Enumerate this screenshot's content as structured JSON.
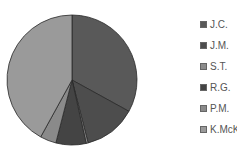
{
  "chart_data": {
    "type": "pie",
    "title": "",
    "start_angle_deg": 0,
    "direction": "clockwise",
    "categories": [
      "J.C.",
      "J.M.",
      "S.T.",
      "R.G.",
      "P.M.",
      "K.McK"
    ],
    "values": [
      33,
      13,
      0.5,
      7.5,
      4,
      42
    ],
    "colors": [
      "#595959",
      "#4d4d4d",
      "#8c8c8c",
      "#444444",
      "#8a8a8a",
      "#9a9a9a"
    ],
    "legend_position": "right"
  },
  "legend": {
    "items": [
      {
        "label": "J.C.",
        "color": "#595959"
      },
      {
        "label": "J.M.",
        "color": "#4d4d4d"
      },
      {
        "label": "S.T.",
        "color": "#8c8c8c"
      },
      {
        "label": "R.G.",
        "color": "#444444"
      },
      {
        "label": "P.M.",
        "color": "#8a8a8a"
      },
      {
        "label": "K.McK",
        "color": "#9a9a9a"
      }
    ]
  }
}
